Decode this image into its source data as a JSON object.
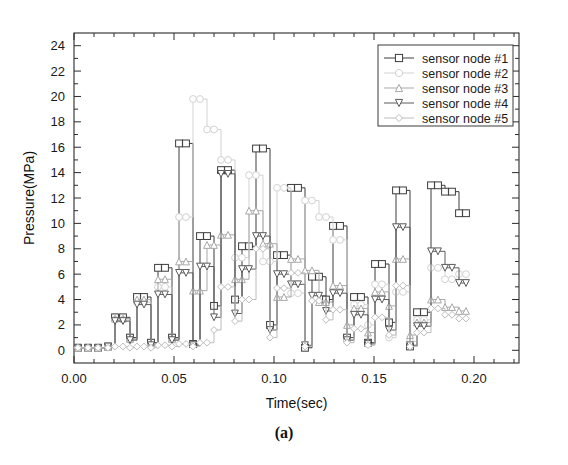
{
  "figure": {
    "caption": "(a)"
  },
  "chart_data": {
    "type": "line",
    "title": "",
    "subtitle": "",
    "xlabel": "Time(sec)",
    "ylabel": "Pressure(MPa)",
    "xlim": [
      0.0,
      0.2225
    ],
    "ylim": [
      -1.0,
      25.0
    ],
    "xticks": [
      0.0,
      0.05,
      0.1,
      0.15,
      0.2
    ],
    "xtick_labels": [
      "0.00",
      "0.05",
      "0.10",
      "0.15",
      "0.20"
    ],
    "x_minor_ticks_per_interval": 5,
    "yticks": [
      0,
      2,
      4,
      6,
      8,
      10,
      12,
      14,
      16,
      18,
      20,
      22,
      24
    ],
    "ytick_labels": [
      "0",
      "2",
      "4",
      "6",
      "8",
      "10",
      "12",
      "14",
      "16",
      "18",
      "20",
      "22",
      "24"
    ],
    "y_minor_ticks_per_interval": 2,
    "grid": false,
    "legend_position": "upper right",
    "line_style": "step",
    "colors": {
      "series1": "#3c3c3c",
      "series2": "#d2d2d2",
      "series3": "#a8a8a8",
      "series4": "#5a5a5a",
      "series5": "#bcbcbc",
      "axis": "#2b2b2b",
      "background": "#ffffff"
    },
    "series": [
      {
        "name": "sensor node #1",
        "marker": "square",
        "color": "#3c3c3c",
        "x": [
          0.002,
          0.007,
          0.012,
          0.017,
          0.0205,
          0.0245,
          0.028,
          0.0315,
          0.035,
          0.0385,
          0.042,
          0.0455,
          0.049,
          0.0525,
          0.056,
          0.0595,
          0.063,
          0.0665,
          0.07,
          0.0735,
          0.077,
          0.0805,
          0.084,
          0.0875,
          0.091,
          0.0945,
          0.098,
          0.1015,
          0.105,
          0.1085,
          0.112,
          0.1155,
          0.119,
          0.1225,
          0.126,
          0.1295,
          0.133,
          0.1365,
          0.14,
          0.1435,
          0.147,
          0.1505,
          0.154,
          0.1575,
          0.161,
          0.1645,
          0.168,
          0.1715,
          0.175,
          0.1785,
          0.182,
          0.1855,
          0.189,
          0.1925,
          0.196
        ],
        "y": [
          0.2,
          0.2,
          0.2,
          0.3,
          2.6,
          2.6,
          1.0,
          4.2,
          4.2,
          0.6,
          6.5,
          6.5,
          1.0,
          16.3,
          16.3,
          0.5,
          9.0,
          9.0,
          3.5,
          14.2,
          14.2,
          4.0,
          8.2,
          8.2,
          15.9,
          15.9,
          2.0,
          7.5,
          7.5,
          12.8,
          12.8,
          0.2,
          5.8,
          5.8,
          4.0,
          9.8,
          9.8,
          1.0,
          4.2,
          4.2,
          0.6,
          6.8,
          6.8,
          2.2,
          12.6,
          12.6,
          0.3,
          3.0,
          3.0,
          13.0,
          13.0,
          12.5,
          12.5,
          10.8,
          10.8
        ]
      },
      {
        "name": "sensor node #2",
        "marker": "circle",
        "color": "#d2d2d2",
        "x": [
          0.002,
          0.007,
          0.012,
          0.017,
          0.0205,
          0.0245,
          0.028,
          0.0315,
          0.035,
          0.0385,
          0.042,
          0.0455,
          0.049,
          0.0525,
          0.056,
          0.0595,
          0.063,
          0.0665,
          0.07,
          0.0735,
          0.077,
          0.0805,
          0.084,
          0.0875,
          0.091,
          0.0945,
          0.098,
          0.1015,
          0.105,
          0.1085,
          0.112,
          0.1155,
          0.119,
          0.1225,
          0.126,
          0.1295,
          0.133,
          0.1365,
          0.14,
          0.1435,
          0.147,
          0.1505,
          0.154,
          0.1575,
          0.161,
          0.1645,
          0.168,
          0.1715,
          0.175,
          0.1785,
          0.182,
          0.1855,
          0.189,
          0.1925,
          0.196
        ],
        "y": [
          0.2,
          0.2,
          0.2,
          0.3,
          2.4,
          2.4,
          0.8,
          3.8,
          3.8,
          0.4,
          5.0,
          5.0,
          0.8,
          10.5,
          10.5,
          19.8,
          19.8,
          17.4,
          17.4,
          15.0,
          15.0,
          7.3,
          7.3,
          13.8,
          13.8,
          7.0,
          7.0,
          12.8,
          12.8,
          4.5,
          4.5,
          11.8,
          11.8,
          10.5,
          10.5,
          8.7,
          8.7,
          0.8,
          3.6,
          3.6,
          2.0,
          5.2,
          5.2,
          1.0,
          4.6,
          4.6,
          0.7,
          2.4,
          2.4,
          6.5,
          6.5,
          5.6,
          5.6,
          6.0,
          6.0
        ]
      },
      {
        "name": "sensor node #3",
        "marker": "triangle-up",
        "color": "#a8a8a8",
        "x": [
          0.002,
          0.007,
          0.012,
          0.017,
          0.0205,
          0.0245,
          0.028,
          0.0315,
          0.035,
          0.0385,
          0.042,
          0.0455,
          0.049,
          0.0525,
          0.056,
          0.0595,
          0.063,
          0.0665,
          0.07,
          0.0735,
          0.077,
          0.0805,
          0.084,
          0.0875,
          0.091,
          0.0945,
          0.098,
          0.1015,
          0.105,
          0.1085,
          0.112,
          0.1155,
          0.119,
          0.1225,
          0.126,
          0.1295,
          0.133,
          0.1365,
          0.14,
          0.1435,
          0.147,
          0.1505,
          0.154,
          0.1575,
          0.161,
          0.1645,
          0.168,
          0.1715,
          0.175,
          0.1785,
          0.182,
          0.1855,
          0.189,
          0.1925,
          0.196
        ],
        "y": [
          0.2,
          0.2,
          0.2,
          0.3,
          2.5,
          2.5,
          0.9,
          4.0,
          4.0,
          0.5,
          5.6,
          5.6,
          0.9,
          7.0,
          7.0,
          4.7,
          4.7,
          8.3,
          8.3,
          9.1,
          9.1,
          5.6,
          5.6,
          11.0,
          11.0,
          8.4,
          8.4,
          4.2,
          4.2,
          7.2,
          7.2,
          6.3,
          6.3,
          3.8,
          3.8,
          5.1,
          5.1,
          2.0,
          3.3,
          3.3,
          1.4,
          4.6,
          4.6,
          3.5,
          7.2,
          7.2,
          1.2,
          2.2,
          2.2,
          4.0,
          4.0,
          3.4,
          3.4,
          3.1,
          3.1
        ]
      },
      {
        "name": "sensor node #4",
        "marker": "triangle-down",
        "color": "#5a5a5a",
        "x": [
          0.002,
          0.007,
          0.012,
          0.017,
          0.0205,
          0.0245,
          0.028,
          0.0315,
          0.035,
          0.0385,
          0.042,
          0.0455,
          0.049,
          0.0525,
          0.056,
          0.0595,
          0.063,
          0.0665,
          0.07,
          0.0735,
          0.077,
          0.0805,
          0.084,
          0.0875,
          0.091,
          0.0945,
          0.098,
          0.1015,
          0.105,
          0.1085,
          0.112,
          0.1155,
          0.119,
          0.1225,
          0.126,
          0.1295,
          0.133,
          0.1365,
          0.14,
          0.1435,
          0.147,
          0.1505,
          0.154,
          0.1575,
          0.161,
          0.1645,
          0.168,
          0.1715,
          0.175,
          0.1785,
          0.182,
          0.1855,
          0.189,
          0.1925,
          0.196
        ],
        "y": [
          0.2,
          0.2,
          0.2,
          0.3,
          2.3,
          2.3,
          0.8,
          3.6,
          3.6,
          0.4,
          4.4,
          4.4,
          0.8,
          6.1,
          6.1,
          0.4,
          6.6,
          6.6,
          2.6,
          13.9,
          13.9,
          2.9,
          6.4,
          6.4,
          9.0,
          9.0,
          1.6,
          6.0,
          6.0,
          5.2,
          5.2,
          0.4,
          4.3,
          4.3,
          3.1,
          4.5,
          4.5,
          0.8,
          2.8,
          2.8,
          0.5,
          4.0,
          4.0,
          1.6,
          9.7,
          9.7,
          0.4,
          1.9,
          1.9,
          7.8,
          7.8,
          6.5,
          6.5,
          5.3,
          5.3
        ]
      },
      {
        "name": "sensor node #5",
        "marker": "diamond",
        "color": "#bcbcbc",
        "x": [
          0.002,
          0.007,
          0.012,
          0.017,
          0.0205,
          0.0245,
          0.028,
          0.0315,
          0.035,
          0.0385,
          0.042,
          0.0455,
          0.049,
          0.0525,
          0.056,
          0.0595,
          0.063,
          0.0665,
          0.07,
          0.0735,
          0.077,
          0.0805,
          0.084,
          0.0875,
          0.091,
          0.0945,
          0.098,
          0.1015,
          0.105,
          0.1085,
          0.112,
          0.1155,
          0.119,
          0.1225,
          0.126,
          0.1295,
          0.133,
          0.1365,
          0.14,
          0.1435,
          0.147,
          0.1505,
          0.154,
          0.1575,
          0.161,
          0.1645,
          0.168,
          0.1715,
          0.175,
          0.1785,
          0.182,
          0.1855,
          0.189,
          0.1925,
          0.196
        ],
        "y": [
          0.2,
          0.2,
          0.2,
          0.2,
          0.3,
          0.3,
          0.2,
          0.3,
          0.3,
          0.2,
          0.4,
          0.4,
          0.3,
          0.5,
          0.5,
          0.3,
          0.6,
          0.6,
          1.6,
          5.0,
          5.0,
          2.3,
          4.0,
          4.0,
          8.0,
          8.0,
          1.0,
          4.9,
          4.9,
          6.1,
          6.1,
          0.3,
          3.9,
          3.9,
          2.4,
          3.2,
          3.2,
          0.6,
          1.7,
          1.7,
          0.4,
          2.6,
          2.6,
          1.2,
          5.1,
          5.1,
          0.3,
          1.4,
          1.4,
          3.3,
          3.3,
          2.8,
          2.8,
          2.5,
          2.5
        ]
      }
    ]
  }
}
